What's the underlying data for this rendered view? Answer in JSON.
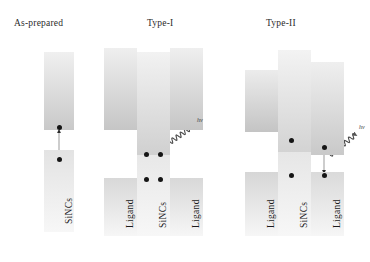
{
  "figure": {
    "caption_absent": true,
    "background": "#ffffff",
    "panels": [
      {
        "id": "as-prepared",
        "title": "As-prepared",
        "title_x": 14,
        "title_y": 18,
        "bands": [
          {
            "name": "sincs-conduction-band",
            "label": "",
            "x": 44,
            "y": 52,
            "w": 30,
            "h": 78,
            "grad_top": "#f0f0f0",
            "grad_bottom": "#c9c9c9"
          },
          {
            "name": "sincs-valence-band",
            "label": "SiNCs",
            "x": 44,
            "y": 150,
            "w": 30,
            "h": 82,
            "grad_top": "#e3e3e3",
            "grad_bottom": "#f7f7f7"
          }
        ],
        "electrons": [
          {
            "name": "electron-conduction",
            "x": 57,
            "y": 125
          },
          {
            "name": "electron-valence",
            "x": 57,
            "y": 157
          }
        ],
        "arrows": [
          {
            "name": "recombination-arrow",
            "x1": 59,
            "y1": 155,
            "x2": 59,
            "y2": 131,
            "double": true
          }
        ],
        "photons": []
      },
      {
        "id": "type-i",
        "title": "Type-I",
        "title_x": 147,
        "title_y": 18,
        "bands": [
          {
            "name": "ligand-left-conduction-band",
            "label": "",
            "x": 104,
            "y": 48,
            "w": 33,
            "h": 82,
            "grad_top": "#efefef",
            "grad_bottom": "#c6c6c6"
          },
          {
            "name": "sincs-conduction-band",
            "label": "",
            "x": 137,
            "y": 52,
            "w": 33,
            "h": 106,
            "grad_top": "#f2f2f2",
            "grad_bottom": "#cfcfcf"
          },
          {
            "name": "ligand-right-conduction-band",
            "label": "",
            "x": 170,
            "y": 48,
            "w": 33,
            "h": 82,
            "grad_top": "#efefef",
            "grad_bottom": "#c6c6c6"
          },
          {
            "name": "ligand-left-valence-band",
            "label": "Ligand",
            "x": 104,
            "y": 178,
            "w": 33,
            "h": 58,
            "grad_top": "#d8d8d8",
            "grad_bottom": "#f6f6f6"
          },
          {
            "name": "sincs-valence-band",
            "label": "SiNCs",
            "x": 137,
            "y": 155,
            "w": 33,
            "h": 81,
            "grad_top": "#e8e8e8",
            "grad_bottom": "#f7f7f7"
          },
          {
            "name": "ligand-right-valence-band",
            "label": "Ligand",
            "x": 170,
            "y": 178,
            "w": 33,
            "h": 58,
            "grad_top": "#d8d8d8",
            "grad_bottom": "#f6f6f6"
          }
        ],
        "electrons": [
          {
            "name": "electron-conduction-left",
            "x": 144,
            "y": 152
          },
          {
            "name": "electron-conduction-right",
            "x": 158,
            "y": 152
          },
          {
            "name": "electron-valence-left",
            "x": 144,
            "y": 177
          },
          {
            "name": "electron-valence-right",
            "x": 158,
            "y": 177
          }
        ],
        "arrows": [
          {
            "name": "excitation-arrow",
            "x1": 146,
            "y1": 176,
            "x2": 146,
            "y2": 158,
            "double": false
          },
          {
            "name": "relaxation-arrow",
            "x1": 160,
            "y1": 158,
            "x2": 160,
            "y2": 176,
            "double": false
          }
        ],
        "photons": [
          {
            "name": "photon-emission-wave",
            "label": "hv",
            "x1": 166,
            "y1": 145,
            "x2": 196,
            "y2": 124,
            "label_x": 197,
            "label_y": 117
          }
        ]
      },
      {
        "id": "type-ii",
        "title": "Type-II",
        "title_x": 266,
        "title_y": 18,
        "bands": [
          {
            "name": "ligand-left-conduction-band",
            "label": "",
            "x": 245,
            "y": 70,
            "w": 33,
            "h": 62,
            "grad_top": "#ececec",
            "grad_bottom": "#c4c4c4"
          },
          {
            "name": "sincs-conduction-band",
            "label": "",
            "x": 278,
            "y": 50,
            "w": 33,
            "h": 105,
            "grad_top": "#f3f3f3",
            "grad_bottom": "#d2d2d2"
          },
          {
            "name": "ligand-right-conduction-band",
            "label": "",
            "x": 311,
            "y": 62,
            "w": 33,
            "h": 93,
            "grad_top": "#efefef",
            "grad_bottom": "#c9c9c9"
          },
          {
            "name": "ligand-left-valence-band",
            "label": "Ligand",
            "x": 245,
            "y": 172,
            "w": 33,
            "h": 64,
            "grad_top": "#d6d6d6",
            "grad_bottom": "#f6f6f6"
          },
          {
            "name": "sincs-valence-band",
            "label": "SiNCs",
            "x": 278,
            "y": 152,
            "w": 33,
            "h": 84,
            "grad_top": "#e6e6e6",
            "grad_bottom": "#f7f7f7"
          },
          {
            "name": "ligand-right-valence-band",
            "label": "Ligand",
            "x": 311,
            "y": 172,
            "w": 33,
            "h": 64,
            "grad_top": "#dadada",
            "grad_bottom": "#f6f6f6"
          }
        ],
        "electrons": [
          {
            "name": "electron-conduction-sincs",
            "x": 289,
            "y": 138
          },
          {
            "name": "electron-conduction-ligand",
            "x": 322,
            "y": 145
          },
          {
            "name": "electron-valence-sincs",
            "x": 289,
            "y": 173
          },
          {
            "name": "electron-valence-ligand",
            "x": 322,
            "y": 173
          }
        ],
        "arrows": [
          {
            "name": "excitation-arrow",
            "x1": 291,
            "y1": 172,
            "x2": 291,
            "y2": 144,
            "double": false
          },
          {
            "name": "relaxation-arrow",
            "x1": 324,
            "y1": 151,
            "x2": 324,
            "y2": 172,
            "double": false
          }
        ],
        "transfer": {
          "name": "charge-transfer-arrow",
          "x1": 297,
          "y1": 136,
          "x2": 319,
          "y2": 145
        },
        "photons": [
          {
            "name": "photon-emission-wave",
            "label": "hv",
            "x1": 330,
            "y1": 155,
            "x2": 360,
            "y2": 131,
            "label_x": 359,
            "label_y": 124
          }
        ]
      }
    ]
  }
}
